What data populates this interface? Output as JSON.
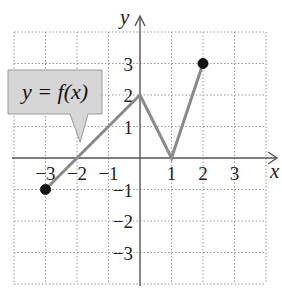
{
  "chart_data": {
    "type": "line",
    "title": "",
    "xlabel": "x",
    "ylabel": "y",
    "xlim": [
      -4,
      4
    ],
    "ylim": [
      -4,
      4
    ],
    "grid": true,
    "grid_style": "dotted",
    "x_ticks": [
      -3,
      -2,
      -1,
      1,
      2,
      3
    ],
    "y_ticks": [
      -3,
      -2,
      -1,
      1,
      2,
      3
    ],
    "x_tick_labels": [
      "−3",
      "−2",
      "−1",
      "1",
      "2",
      "3"
    ],
    "y_tick_labels": [
      "−3",
      "−2",
      "−1",
      "1",
      "2",
      "3"
    ],
    "series": [
      {
        "name": "y = f(x)",
        "x": [
          -3,
          0,
          1,
          2
        ],
        "y": [
          -1,
          2,
          0,
          3
        ],
        "color": "#8a8a8a",
        "endpoints": [
          {
            "x": -3,
            "y": -1,
            "filled": true
          },
          {
            "x": 2,
            "y": 3,
            "filled": true
          }
        ]
      }
    ],
    "annotations": [
      {
        "text": "y = f(x)",
        "type": "callout",
        "points_to": {
          "x": -1.9,
          "y": 0.5
        }
      }
    ]
  },
  "labels": {
    "x_axis": "x",
    "y_axis": "y",
    "callout": "y = f(x)"
  },
  "colors": {
    "grid": "#9a9a9a",
    "axis": "#555555",
    "curve": "#8a8a8a",
    "point": "#111111",
    "callout_fill": "#d6d6d6",
    "callout_border": "#9a9a9a"
  }
}
